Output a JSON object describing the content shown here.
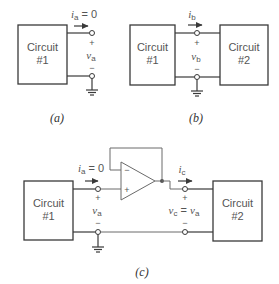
{
  "figure_a": {
    "caption": "(a)",
    "circuit1": {
      "line1": "Circuit",
      "line2": "#1"
    },
    "current_label": {
      "sym": "i",
      "sub": "a",
      "rest": " = 0"
    },
    "voltage_label": {
      "sym": "v",
      "sub": "a"
    },
    "plus": "+",
    "minus": "−"
  },
  "figure_b": {
    "caption": "(b)",
    "circuit1": {
      "line1": "Circuit",
      "line2": "#1"
    },
    "circuit2": {
      "line1": "Circuit",
      "line2": "#2"
    },
    "current_label": {
      "sym": "i",
      "sub": "b"
    },
    "voltage_label": {
      "sym": "v",
      "sub": "b"
    },
    "plus": "+",
    "minus": "−"
  },
  "figure_c": {
    "caption": "(c)",
    "circuit1": {
      "line1": "Circuit",
      "line2": "#1"
    },
    "circuit2": {
      "line1": "Circuit",
      "line2": "#2"
    },
    "input_current_label": {
      "sym": "i",
      "sub": "a",
      "rest": " = 0"
    },
    "input_voltage_label": {
      "sym": "v",
      "sub": "a"
    },
    "output_current_label": {
      "sym": "i",
      "sub": "c"
    },
    "output_voltage_label": {
      "sym1": "v",
      "sub1": "c",
      "eq": " = ",
      "sym2": "v",
      "sub2": "a"
    },
    "opamp": {
      "inverting": "−",
      "noninverting": "+"
    },
    "plus": "+",
    "minus": "−"
  }
}
